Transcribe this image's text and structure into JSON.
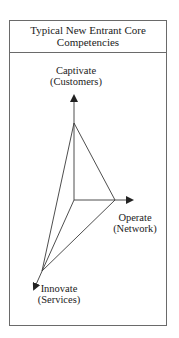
{
  "title": {
    "line1": "Typical New Entrant Core",
    "line2": "Competencies"
  },
  "axes": [
    {
      "name": "Captivate",
      "sub": "(Customers)",
      "direction": "up"
    },
    {
      "name": "Operate",
      "sub": "(Network)",
      "direction": "right"
    },
    {
      "name": "Innovate",
      "sub": "(Services)",
      "direction": "down-left"
    }
  ],
  "colors": {
    "line": "#3a3a3a",
    "frame": "#6a6a6a",
    "background": "#ffffff"
  }
}
